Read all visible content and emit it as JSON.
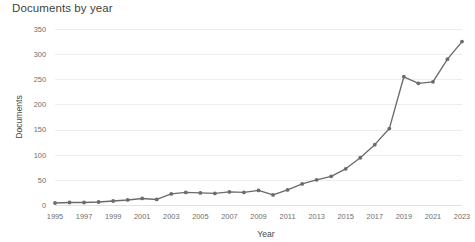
{
  "chart_data": {
    "type": "line",
    "title": "Documents by year",
    "xlabel": "Year",
    "ylabel": "Documents",
    "grid": true,
    "legend": false,
    "legend_position": "none",
    "xlim": [
      1995,
      2023
    ],
    "ylim": [
      0,
      350
    ],
    "y_ticks": [
      0,
      50,
      100,
      150,
      200,
      250,
      300,
      350
    ],
    "y_tick_labels": [
      "0",
      "50",
      "100",
      "150",
      "200",
      "250",
      "300",
      "350"
    ],
    "x_ticks": [
      1995,
      1997,
      1999,
      2001,
      2003,
      2005,
      2007,
      2009,
      2011,
      2013,
      2015,
      2017,
      2019,
      2021,
      2023
    ],
    "x_tick_labels": [
      "1995",
      "1997",
      "1999",
      "2001",
      "2003",
      "2005",
      "2007",
      "2009",
      "2011",
      "2013",
      "2015",
      "2017",
      "2019",
      "2021",
      "2023"
    ],
    "series_color": "#6b6b6b",
    "marker": "circle",
    "categories": [
      1995,
      1996,
      1997,
      1998,
      1999,
      2000,
      2001,
      2002,
      2003,
      2004,
      2005,
      2006,
      2007,
      2008,
      2009,
      2010,
      2011,
      2012,
      2013,
      2014,
      2015,
      2016,
      2017,
      2018,
      2019,
      2020,
      2021,
      2022,
      2023
    ],
    "values": [
      4,
      5,
      5,
      6,
      8,
      10,
      13,
      11,
      22,
      25,
      24,
      23,
      26,
      25,
      29,
      20,
      30,
      42,
      50,
      57,
      72,
      94,
      120,
      152,
      255,
      242,
      245,
      290,
      325
    ]
  }
}
